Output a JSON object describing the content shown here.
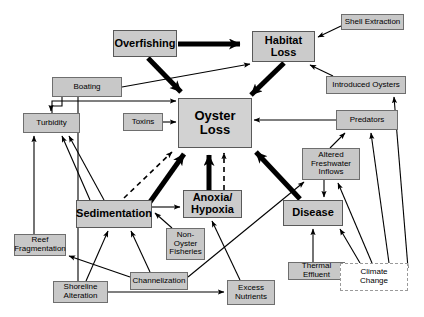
{
  "diagram": {
    "canvas": {
      "width": 424,
      "height": 317,
      "background": "#ffffff"
    },
    "colors": {
      "node_fill": "#cfcfcf",
      "node_border": "#6e6e6e",
      "dashed_border": "#9a9a9a",
      "arrow": "#000000",
      "background": "#ffffff"
    },
    "nodes": [
      {
        "id": "overfishing",
        "label": "Overfishing",
        "style": "major",
        "x": 113,
        "y": 30,
        "w": 64,
        "h": 27
      },
      {
        "id": "habitat_loss",
        "label": "Habitat\nLoss",
        "style": "major",
        "x": 252,
        "y": 31,
        "w": 63,
        "h": 31
      },
      {
        "id": "shell_extraction",
        "label": "Shell Extraction",
        "style": "small",
        "x": 341,
        "y": 14,
        "w": 63,
        "h": 16
      },
      {
        "id": "boating",
        "label": "Boating",
        "style": "small",
        "x": 52,
        "y": 77,
        "w": 70,
        "h": 20
      },
      {
        "id": "introduced_oysters",
        "label": "Introduced Oysters",
        "style": "small",
        "x": 326,
        "y": 76,
        "w": 80,
        "h": 18
      },
      {
        "id": "oyster_loss",
        "label": "Oyster\nLoss",
        "style": "hub",
        "x": 178,
        "y": 98,
        "w": 74,
        "h": 50
      },
      {
        "id": "turbidity",
        "label": "Turbidity",
        "style": "small",
        "x": 23,
        "y": 113,
        "w": 57,
        "h": 20
      },
      {
        "id": "toxins",
        "label": "Toxins",
        "style": "small",
        "x": 123,
        "y": 113,
        "w": 40,
        "h": 18
      },
      {
        "id": "predators",
        "label": "Predators",
        "style": "small",
        "x": 336,
        "y": 110,
        "w": 62,
        "h": 20
      },
      {
        "id": "altered_freshwater_inflows",
        "label": "Altered\nFreshwater\nInflows",
        "style": "small",
        "x": 302,
        "y": 148,
        "w": 58,
        "h": 32
      },
      {
        "id": "anoxia_hypoxia",
        "label": "Anoxia/\nHypoxia",
        "style": "major",
        "x": 183,
        "y": 190,
        "w": 59,
        "h": 28
      },
      {
        "id": "sedimentation",
        "label": "Sedimentation",
        "style": "major",
        "x": 76,
        "y": 200,
        "w": 76,
        "h": 28
      },
      {
        "id": "disease",
        "label": "Disease",
        "style": "major",
        "x": 283,
        "y": 200,
        "w": 60,
        "h": 26
      },
      {
        "id": "non_oyster_fisheries",
        "label": "Non-\nOyster\nFisheries",
        "style": "small",
        "x": 166,
        "y": 228,
        "w": 39,
        "h": 32
      },
      {
        "id": "reef_fragmentation",
        "label": "Reef\nFragmentation",
        "style": "small",
        "x": 14,
        "y": 234,
        "w": 52,
        "h": 22
      },
      {
        "id": "channelization",
        "label": "Channelization",
        "style": "small",
        "x": 130,
        "y": 272,
        "w": 58,
        "h": 18
      },
      {
        "id": "thermal_effluent",
        "label": "Thermal Effluent",
        "style": "small",
        "x": 288,
        "y": 262,
        "w": 57,
        "h": 18
      },
      {
        "id": "climate_change",
        "label": "Climate\nChange",
        "style": "dashed",
        "x": 340,
        "y": 263,
        "w": 68,
        "h": 28
      },
      {
        "id": "shoreline_alteration",
        "label": "Shoreline\nAlteration",
        "style": "small",
        "x": 53,
        "y": 281,
        "w": 55,
        "h": 22
      },
      {
        "id": "excess_nutrients",
        "label": "Excess\nNutrients",
        "style": "small",
        "x": 227,
        "y": 280,
        "w": 48,
        "h": 25
      }
    ],
    "edges": [
      {
        "from": "overfishing",
        "to": "habitat_loss",
        "weight": "heavy",
        "dash": false
      },
      {
        "from": "overfishing",
        "to": "oyster_loss",
        "weight": "heavy",
        "dash": false
      },
      {
        "from": "shell_extraction",
        "to": "habitat_loss",
        "weight": "thin",
        "dash": false
      },
      {
        "from": "habitat_loss",
        "to": "oyster_loss",
        "weight": "heavy",
        "dash": false
      },
      {
        "from": "introduced_oysters",
        "to": "habitat_loss",
        "weight": "thin",
        "dash": false
      },
      {
        "from": "boating",
        "to": "turbidity",
        "weight": "thin",
        "dash": false
      },
      {
        "from": "boating",
        "to": "habitat_loss",
        "weight": "thin",
        "dash": false
      },
      {
        "from": "boating",
        "to": "shoreline_alteration",
        "weight": "thin",
        "dash": false
      },
      {
        "from": "toxins",
        "to": "oyster_loss",
        "weight": "thin",
        "dash": false
      },
      {
        "from": "predators",
        "to": "oyster_loss",
        "weight": "thin",
        "dash": false
      },
      {
        "from": "altered_freshwater_inflows",
        "to": "predators",
        "weight": "thin",
        "dash": false
      },
      {
        "from": "altered_freshwater_inflows",
        "to": "disease",
        "weight": "thin",
        "dash": false
      },
      {
        "from": "sedimentation",
        "to": "oyster_loss",
        "weight": "heavy",
        "dash": false
      },
      {
        "from": "sedimentation",
        "to": "oyster_loss",
        "weight": "thin",
        "dash": true
      },
      {
        "from": "sedimentation",
        "to": "anoxia_hypoxia",
        "weight": "thin",
        "dash": false
      },
      {
        "from": "anoxia_hypoxia",
        "to": "oyster_loss",
        "weight": "heavy",
        "dash": false
      },
      {
        "from": "anoxia_hypoxia",
        "to": "oyster_loss",
        "weight": "thin",
        "dash": true
      },
      {
        "from": "disease",
        "to": "oyster_loss",
        "weight": "heavy",
        "dash": false
      },
      {
        "from": "non_oyster_fisheries",
        "to": "sedimentation",
        "weight": "thin",
        "dash": false
      },
      {
        "from": "turbidity",
        "to": "oyster_loss",
        "weight": "thin",
        "dash": false
      },
      {
        "from": "sedimentation",
        "to": "turbidity",
        "weight": "thin",
        "dash": false
      },
      {
        "from": "channelization",
        "to": "sedimentation",
        "weight": "thin",
        "dash": false
      },
      {
        "from": "channelization",
        "to": "reef_fragmentation",
        "weight": "thin",
        "dash": false
      },
      {
        "from": "channelization",
        "to": "altered_freshwater_inflows",
        "weight": "thin",
        "dash": false
      },
      {
        "from": "shoreline_alteration",
        "to": "sedimentation",
        "weight": "thin",
        "dash": false
      },
      {
        "from": "shoreline_alteration",
        "to": "excess_nutrients",
        "weight": "thin",
        "dash": false
      },
      {
        "from": "excess_nutrients",
        "to": "anoxia_hypoxia",
        "weight": "thin",
        "dash": false
      },
      {
        "from": "thermal_effluent",
        "to": "disease",
        "weight": "thin",
        "dash": false
      },
      {
        "from": "climate_change",
        "to": "disease",
        "weight": "thin",
        "dash": false
      },
      {
        "from": "climate_change",
        "to": "altered_freshwater_inflows",
        "weight": "thin",
        "dash": false
      },
      {
        "from": "climate_change",
        "to": "predators",
        "weight": "thin",
        "dash": false
      },
      {
        "from": "climate_change",
        "to": "introduced_oysters",
        "weight": "thin",
        "dash": false
      },
      {
        "from": "reef_fragmentation",
        "to": "turbidity",
        "weight": "thin",
        "dash": false
      }
    ]
  }
}
